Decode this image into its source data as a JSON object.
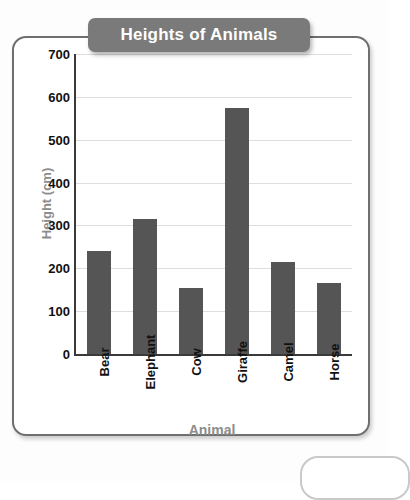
{
  "chart_data": {
    "type": "bar",
    "title": "Heights of Animals",
    "xlabel": "Animal",
    "ylabel": "Height (cm)",
    "categories": [
      "Bear",
      "Elephant",
      "Cow",
      "Giraffe",
      "Camel",
      "Horse"
    ],
    "values": [
      240,
      315,
      155,
      575,
      215,
      165
    ],
    "ylim": [
      0,
      700
    ],
    "ytick_step": 100,
    "yticks": [
      0,
      100,
      200,
      300,
      400,
      500,
      600,
      700
    ],
    "ytick_labels": [
      "0",
      "100",
      "200",
      "300",
      "400",
      "500",
      "600",
      "700"
    ],
    "grid": true,
    "legend": false,
    "bar_color": "#555555",
    "title_background": "#7a7a7a",
    "title_text_color": "#ffffff",
    "axis_title_color": "#8c8c8c",
    "gridline_color": "#dedede"
  }
}
